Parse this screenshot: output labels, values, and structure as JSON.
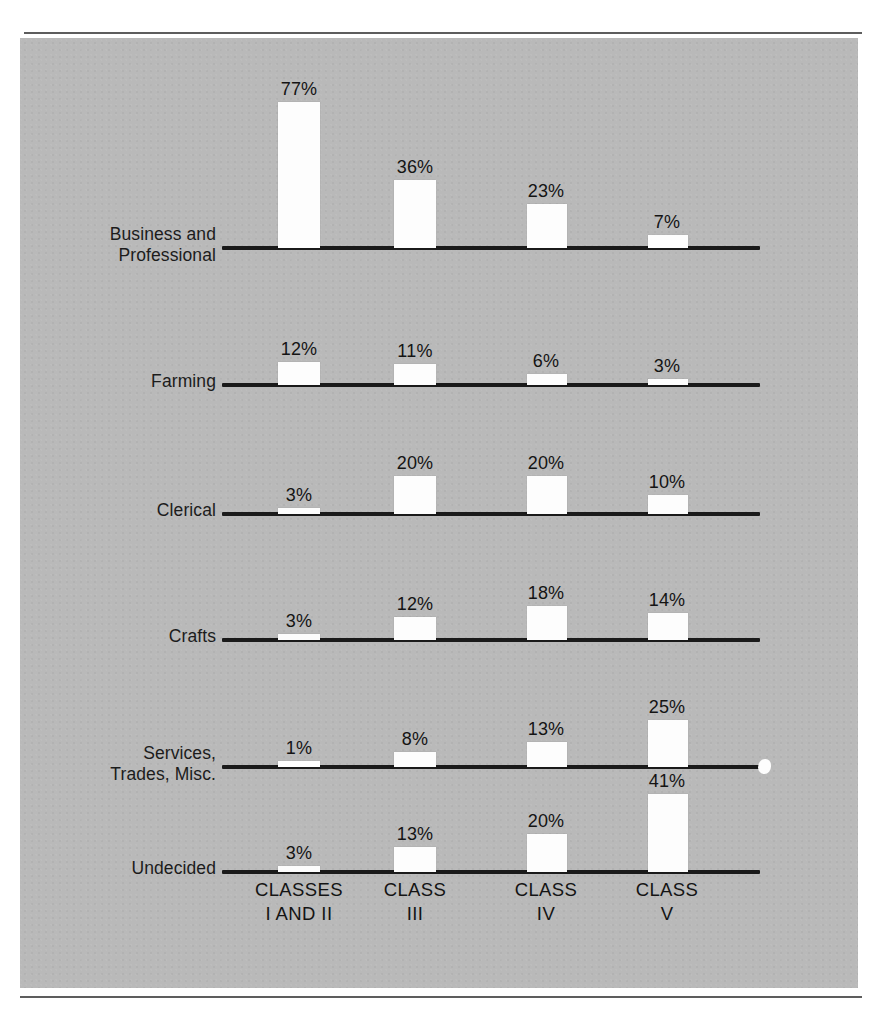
{
  "chart_data": {
    "type": "bar",
    "title": "",
    "subtitle": "",
    "xlabel": "",
    "ylabel": "",
    "grid": false,
    "legend": "none",
    "units": "percent",
    "orientation": "vertical-grouped-by-row",
    "categories": [
      "CLASSES\nI AND II",
      "CLASS\nIII",
      "CLASS\nIV",
      "CLASS\nV"
    ],
    "category_labels_flat": [
      "CLASSES I AND II",
      "CLASS III",
      "CLASS IV",
      "CLASS V"
    ],
    "series": [
      {
        "name": "Business and\nProfessional",
        "values": [
          77,
          36,
          23,
          7
        ],
        "value_labels": [
          "77%",
          "36%",
          "23%",
          "7%"
        ]
      },
      {
        "name": "Farming",
        "values": [
          12,
          11,
          6,
          3
        ],
        "value_labels": [
          "12%",
          "11%",
          "6%",
          "3%"
        ]
      },
      {
        "name": "Clerical",
        "values": [
          3,
          20,
          20,
          10
        ],
        "value_labels": [
          "3%",
          "20%",
          "20%",
          "10%"
        ]
      },
      {
        "name": "Crafts",
        "values": [
          3,
          12,
          18,
          14
        ],
        "value_labels": [
          "3%",
          "12%",
          "18%",
          "14%"
        ]
      },
      {
        "name": "Services,\nTrades, Misc.",
        "values": [
          1,
          8,
          13,
          25
        ],
        "value_labels": [
          "1%",
          "8%",
          "13%",
          "25%"
        ]
      },
      {
        "name": "Undecided",
        "values": [
          3,
          13,
          20,
          41
        ],
        "value_labels": [
          "3%",
          "13%",
          "20%",
          "41%"
        ]
      }
    ],
    "ylim": [
      0,
      80
    ],
    "colors": {
      "plate_background": "#b9b9b9",
      "bar_fill": "#fdfdfd",
      "axis_line": "#1a1a1a",
      "text": "#141414",
      "page_background": "#ffffff",
      "rule": "#5d5d5d"
    }
  },
  "layout": {
    "rows": [
      {
        "baseline": 208,
        "label_top": 186,
        "label_align_right": 196,
        "axis_left": 202,
        "axis_width": 538
      },
      {
        "baseline": 345,
        "label_top": 333,
        "label_align_right": 196,
        "axis_left": 202,
        "axis_width": 538
      },
      {
        "baseline": 474,
        "label_top": 462,
        "label_align_right": 196,
        "axis_left": 202,
        "axis_width": 538
      },
      {
        "baseline": 600,
        "label_top": 588,
        "label_align_right": 196,
        "axis_left": 202,
        "axis_width": 538
      },
      {
        "baseline": 727,
        "label_top": 705,
        "label_align_right": 196,
        "axis_left": 202,
        "axis_width": 540
      },
      {
        "baseline": 832,
        "label_top": 820,
        "label_align_right": 196,
        "axis_left": 202,
        "axis_width": 538
      }
    ],
    "columns": [
      {
        "center": 279,
        "bar_left": 258,
        "bar_width": 42
      },
      {
        "center": 395,
        "bar_left": 374,
        "bar_width": 42
      },
      {
        "center": 526,
        "bar_left": 507,
        "bar_width": 40
      },
      {
        "center": 647,
        "bar_left": 628,
        "bar_width": 40
      }
    ],
    "px_per_percent": 1.9,
    "category_label_top": 840
  }
}
